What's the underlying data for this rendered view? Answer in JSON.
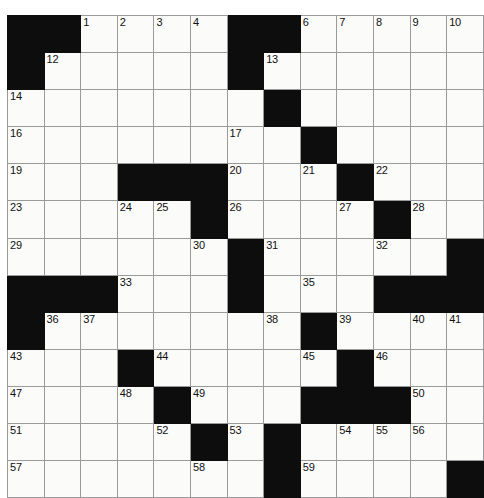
{
  "puzzle": {
    "kind": "crossword-grid",
    "rows": 13,
    "cols": 13,
    "colors": {
      "block": "#0d0d0d",
      "cell": "#fbfbf9",
      "grid_line": "#9a9a9a",
      "number_text": "#101010",
      "page_background": "#ffffff"
    },
    "grid": [
      [
        "#",
        "#",
        "1",
        "2",
        "3",
        "4",
        "5",
        "#",
        "#",
        "6",
        "7",
        "8",
        "9",
        "10",
        "11"
      ],
      [
        "#",
        "12",
        "",
        "",
        "",
        "",
        "",
        "#",
        "13",
        "",
        "",
        "",
        "",
        ""
      ],
      [
        "14",
        "",
        "",
        "",
        "",
        "",
        "",
        "#",
        "15",
        "",
        "",
        "",
        "",
        ""
      ],
      [
        "16",
        "",
        "",
        "",
        "",
        "",
        "",
        "17",
        "",
        "#",
        "18",
        "",
        "",
        "",
        ""
      ],
      [
        "19",
        "",
        "",
        "#",
        "#",
        "#",
        "20",
        "",
        "",
        "21",
        "#",
        "22",
        "",
        "",
        ""
      ],
      [
        "23",
        "",
        "",
        "24",
        "25",
        "#",
        "26",
        "",
        "",
        "",
        "27",
        "#",
        "28",
        "",
        ""
      ],
      [
        "29",
        "",
        "",
        "",
        "",
        "30",
        "#",
        "31",
        "",
        "",
        "",
        "32",
        "",
        "",
        "#"
      ],
      [
        "#",
        "#",
        "#",
        "33",
        "",
        "",
        "34",
        "#",
        "35",
        "",
        "",
        "",
        "#",
        "#",
        "#"
      ],
      [
        "#",
        "36",
        "37",
        "",
        "",
        "",
        "",
        "38",
        "#",
        "39",
        "",
        "",
        "40",
        "41",
        "42"
      ],
      [
        "43",
        "",
        "",
        "#",
        "44",
        "",
        "",
        "",
        "45",
        "#",
        "46",
        "",
        "",
        "",
        ""
      ],
      [
        "47",
        "",
        "",
        "48",
        "#",
        "49",
        "",
        "",
        "",
        "#",
        "#",
        "#",
        "50",
        "",
        ""
      ],
      [
        "51",
        "",
        "",
        "",
        "52",
        "#",
        "53",
        "",
        "",
        "54",
        "55",
        "56",
        "",
        "",
        ""
      ],
      [
        "57",
        "",
        "",
        "",
        "",
        "58",
        "",
        "#",
        "59",
        "",
        "",
        "",
        "",
        ""
      ],
      [
        "60",
        "",
        "",
        "",
        "",
        "",
        "",
        "#",
        "61",
        "",
        "",
        "",
        "",
        "#"
      ],
      [
        "62",
        "",
        "",
        "",
        "",
        "",
        "#",
        "#",
        "63",
        "",
        "",
        "",
        "#",
        "#"
      ]
    ],
    "blocks": [
      [
        0,
        0
      ],
      [
        0,
        1
      ],
      [
        0,
        6
      ],
      [
        0,
        7
      ],
      [
        1,
        0
      ],
      [
        1,
        6
      ],
      [
        2,
        7
      ],
      [
        3,
        8
      ],
      [
        4,
        3
      ],
      [
        4,
        4
      ],
      [
        4,
        5
      ],
      [
        4,
        9
      ],
      [
        5,
        5
      ],
      [
        5,
        10
      ],
      [
        6,
        6
      ],
      [
        6,
        12
      ],
      [
        7,
        0
      ],
      [
        7,
        1
      ],
      [
        7,
        2
      ],
      [
        7,
        6
      ],
      [
        7,
        10
      ],
      [
        7,
        11
      ],
      [
        7,
        12
      ],
      [
        8,
        0
      ],
      [
        8,
        8
      ],
      [
        9,
        3
      ],
      [
        9,
        9
      ],
      [
        10,
        4
      ],
      [
        10,
        8
      ],
      [
        10,
        9
      ],
      [
        10,
        10
      ],
      [
        11,
        5
      ],
      [
        11,
        7
      ],
      [
        12,
        7
      ],
      [
        12,
        12
      ],
      [
        13,
        6
      ],
      [
        13,
        7
      ]
    ],
    "numbers": [
      {
        "row": 0,
        "col": 2,
        "n": "1"
      },
      {
        "row": 0,
        "col": 3,
        "n": "2"
      },
      {
        "row": 0,
        "col": 4,
        "n": "3"
      },
      {
        "row": 0,
        "col": 5,
        "n": "4"
      },
      {
        "row": 0,
        "col": 6,
        "n": "5"
      },
      {
        "row": 0,
        "col": 8,
        "n": "6"
      },
      {
        "row": 0,
        "col": 9,
        "n": "7"
      },
      {
        "row": 0,
        "col": 10,
        "n": "8"
      },
      {
        "row": 0,
        "col": 11,
        "n": "9"
      },
      {
        "row": 0,
        "col": 12,
        "n": "10"
      },
      {
        "row": 1,
        "col": 1,
        "n": "12"
      },
      {
        "row": 1,
        "col": 7,
        "n": "13"
      },
      {
        "row": 2,
        "col": 0,
        "n": "14"
      },
      {
        "row": 2,
        "col": 7,
        "n": "15"
      },
      {
        "row": 3,
        "col": 0,
        "n": "16"
      },
      {
        "row": 3,
        "col": 6,
        "n": "17"
      },
      {
        "row": 3,
        "col": 8,
        "n": "18"
      },
      {
        "row": 4,
        "col": 0,
        "n": "19"
      },
      {
        "row": 4,
        "col": 6,
        "n": "20"
      },
      {
        "row": 4,
        "col": 8,
        "n": "21"
      },
      {
        "row": 4,
        "col": 10,
        "n": "22"
      },
      {
        "row": 5,
        "col": 0,
        "n": "23"
      },
      {
        "row": 5,
        "col": 3,
        "n": "24"
      },
      {
        "row": 5,
        "col": 4,
        "n": "25"
      },
      {
        "row": 5,
        "col": 6,
        "n": "26"
      },
      {
        "row": 5,
        "col": 9,
        "n": "27"
      },
      {
        "row": 5,
        "col": 11,
        "n": "28"
      },
      {
        "row": 6,
        "col": 0,
        "n": "29"
      },
      {
        "row": 6,
        "col": 5,
        "n": "30"
      },
      {
        "row": 6,
        "col": 7,
        "n": "31"
      },
      {
        "row": 6,
        "col": 10,
        "n": "32"
      },
      {
        "row": 7,
        "col": 3,
        "n": "33"
      },
      {
        "row": 7,
        "col": 6,
        "n": "34"
      },
      {
        "row": 7,
        "col": 8,
        "n": "35"
      },
      {
        "row": 8,
        "col": 1,
        "n": "36"
      },
      {
        "row": 8,
        "col": 2,
        "n": "37"
      },
      {
        "row": 8,
        "col": 7,
        "n": "38"
      },
      {
        "row": 8,
        "col": 9,
        "n": "39"
      },
      {
        "row": 8,
        "col": 11,
        "n": "40"
      },
      {
        "row": 8,
        "col": 12,
        "n": "41"
      },
      {
        "row": 9,
        "col": 0,
        "n": "43"
      },
      {
        "row": 9,
        "col": 4,
        "n": "44"
      },
      {
        "row": 9,
        "col": 8,
        "n": "45"
      },
      {
        "row": 9,
        "col": 10,
        "n": "46"
      },
      {
        "row": 10,
        "col": 0,
        "n": "47"
      },
      {
        "row": 10,
        "col": 3,
        "n": "48"
      },
      {
        "row": 10,
        "col": 5,
        "n": "49"
      },
      {
        "row": 10,
        "col": 11,
        "n": "50"
      },
      {
        "row": 11,
        "col": 0,
        "n": "51"
      },
      {
        "row": 11,
        "col": 4,
        "n": "52"
      },
      {
        "row": 11,
        "col": 6,
        "n": "53"
      },
      {
        "row": 11,
        "col": 9,
        "n": "54"
      },
      {
        "row": 11,
        "col": 10,
        "n": "55"
      },
      {
        "row": 11,
        "col": 11,
        "n": "56"
      },
      {
        "row": 12,
        "col": 0,
        "n": "57"
      },
      {
        "row": 12,
        "col": 5,
        "n": "58"
      },
      {
        "row": 12,
        "col": 8,
        "n": "59"
      },
      {
        "row": 13,
        "col": 0,
        "n": "60"
      },
      {
        "row": 13,
        "col": 8,
        "n": "61"
      },
      {
        "row": 14,
        "col": 0,
        "n": "62"
      },
      {
        "row": 14,
        "col": 8,
        "n": "63"
      }
    ]
  }
}
